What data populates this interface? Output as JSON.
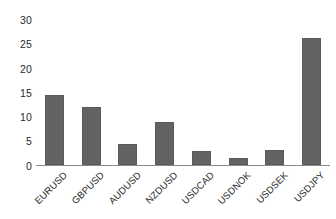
{
  "chart_data": {
    "type": "bar",
    "title": "",
    "subtitle": "",
    "xlabel": "",
    "ylabel": "",
    "categories": [
      "EURUSD",
      "GBPUSD",
      "AUDUSD",
      "NZDUSD",
      "USDCAD",
      "USDNOK",
      "USDSEK",
      "USDJPY"
    ],
    "values": [
      13.8,
      11.5,
      4.2,
      8.4,
      2.7,
      1.3,
      3.0,
      25.2
    ],
    "series": [
      {
        "name": "",
        "values": [
          13.8,
          11.5,
          4.2,
          8.4,
          2.7,
          1.3,
          3.0,
          25.2
        ]
      }
    ],
    "ylim": [
      0,
      30
    ],
    "yticks": [
      0,
      5,
      10,
      15,
      20,
      25,
      30
    ],
    "ytick_labels": [
      "0",
      "5",
      "10",
      "15",
      "20",
      "25",
      "30"
    ],
    "grid": false,
    "legend": false,
    "legend_position": "none",
    "bar_color": "#636363",
    "axis_color": "#8a8a8a",
    "text_color": "#2b2b2b",
    "background_color": "#ffffff",
    "xtick_rotation": -45,
    "annotations": []
  }
}
